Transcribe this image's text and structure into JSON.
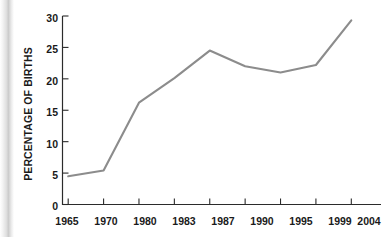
{
  "chart_data": {
    "type": "line",
    "title": "",
    "xlabel": "",
    "ylabel": "PERCENTAGE OF BIRTHS",
    "categories": [
      "1965",
      "1970",
      "1980",
      "1983",
      "1987",
      "1990",
      "1995",
      "1999",
      "2004"
    ],
    "values": [
      4.5,
      5.4,
      16.2,
      20.1,
      24.5,
      22.0,
      21.0,
      22.2,
      29.3
    ],
    "series": [
      {
        "name": "Percentage of births",
        "values": [
          4.5,
          5.4,
          16.2,
          20.1,
          24.5,
          22.0,
          21.0,
          22.2,
          29.3
        ]
      }
    ],
    "ylim": [
      0,
      30
    ],
    "yticks": [
      0,
      5,
      10,
      15,
      20,
      25,
      30
    ],
    "ytick_labels": [
      "0",
      "5",
      "10",
      "15",
      "20",
      "25",
      "30"
    ],
    "grid": false,
    "legend": "none",
    "line_color": "#8c8c8c",
    "axis_color": "#2b2b2b",
    "text_color": "#1a1a1a"
  },
  "axis": {
    "y_title": "PERCENTAGE OF BIRTHS",
    "y_labels": [
      "30",
      "25",
      "20",
      "15",
      "10",
      "5",
      "0"
    ],
    "x_labels": [
      "1965",
      "1970",
      "1980",
      "1983",
      "1987",
      "1990",
      "1995",
      "1999",
      "2004"
    ]
  }
}
